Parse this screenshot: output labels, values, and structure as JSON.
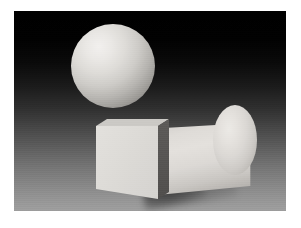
{
  "image": {
    "title": "3D Rendered Primitives Still Life",
    "caption": "",
    "width_px": 301,
    "height_px": 228,
    "frame": {
      "name": "white-mat-border",
      "color": "#ffffff",
      "left_px": 14,
      "top_px": 11,
      "right_px": 15,
      "bottom_px": 17
    },
    "canvas": {
      "left_px": 14,
      "top_px": 11,
      "width_px": 272,
      "height_px": 200
    }
  },
  "scene": {
    "description": "Computer graphics test render of three geometric primitives resting on a ground plane, lit from the upper left against a dark-to-light vertical gradient backdrop.",
    "lighting": {
      "key_light_direction": "upper-left",
      "ambient": "low"
    },
    "background": {
      "name": "gradient-backdrop",
      "type": "vertical-gradient",
      "top_color": "#000000",
      "bottom_color": "#9e9e9e"
    },
    "objects": [
      {
        "id": "sphere",
        "label": "Sphere",
        "shape": "sphere",
        "shading": "smooth-diffuse",
        "highlight_color": "#f2f0ee",
        "terminator_color": "#636161",
        "center_px": [
          113,
          66
        ],
        "radius_px": 42
      },
      {
        "id": "cube",
        "label": "Cube",
        "shape": "cube",
        "shading": "flat-faceted",
        "front_face_color": "#dedcd8",
        "right_face_color": "#565452",
        "top_face_color": "#cbc9c5",
        "front_top_left_px": [
          82,
          115
        ],
        "front_bottom_right_px": [
          143,
          188
        ]
      },
      {
        "id": "cylinder",
        "label": "Cylinder",
        "shape": "cylinder",
        "orientation": "horizontal-tilted",
        "shading": "smooth-diffuse",
        "body_highlight_color": "#e4e1dd",
        "body_shadow_color": "#918e8a",
        "cap_color": "#e5e2de",
        "cap_center_px": [
          235,
          140
        ],
        "cap_radius_px": [
          22,
          35
        ]
      }
    ],
    "shadows": [
      {
        "id": "cube-shadow",
        "label": "Cube cast shadow",
        "opacity": 0.42
      },
      {
        "id": "cylinder-shadow",
        "label": "Cylinder cast shadow",
        "opacity": 0.3
      }
    ]
  },
  "chart_data": null
}
